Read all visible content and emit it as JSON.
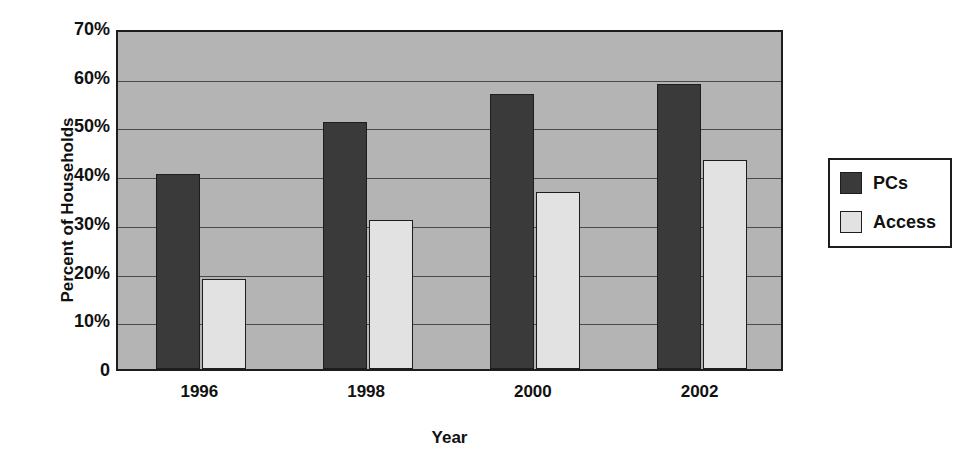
{
  "chart_data": {
    "type": "bar",
    "title": "",
    "xlabel": "Year",
    "ylabel": "Percent of Households",
    "categories": [
      "1996",
      "1998",
      "2000",
      "2002"
    ],
    "series": [
      {
        "name": "PCs",
        "values": [
          40.0,
          50.7,
          56.5,
          58.5
        ],
        "color": "#3a3a3a"
      },
      {
        "name": "Access",
        "values": [
          18.5,
          30.5,
          36.3,
          43.0
        ],
        "color": "#e2e2e2"
      }
    ],
    "ylim": [
      0,
      70
    ],
    "yticks": [
      "0",
      "10%",
      "20%",
      "30%",
      "40%",
      "50%",
      "60%",
      "70%"
    ],
    "ytick_values": [
      0,
      10,
      20,
      30,
      40,
      50,
      60,
      70
    ],
    "grid": true,
    "legend_position": "right",
    "plot_background": "#b4b4b4",
    "page_background": "#ffffff",
    "axis_color": "#1d1d1d"
  }
}
